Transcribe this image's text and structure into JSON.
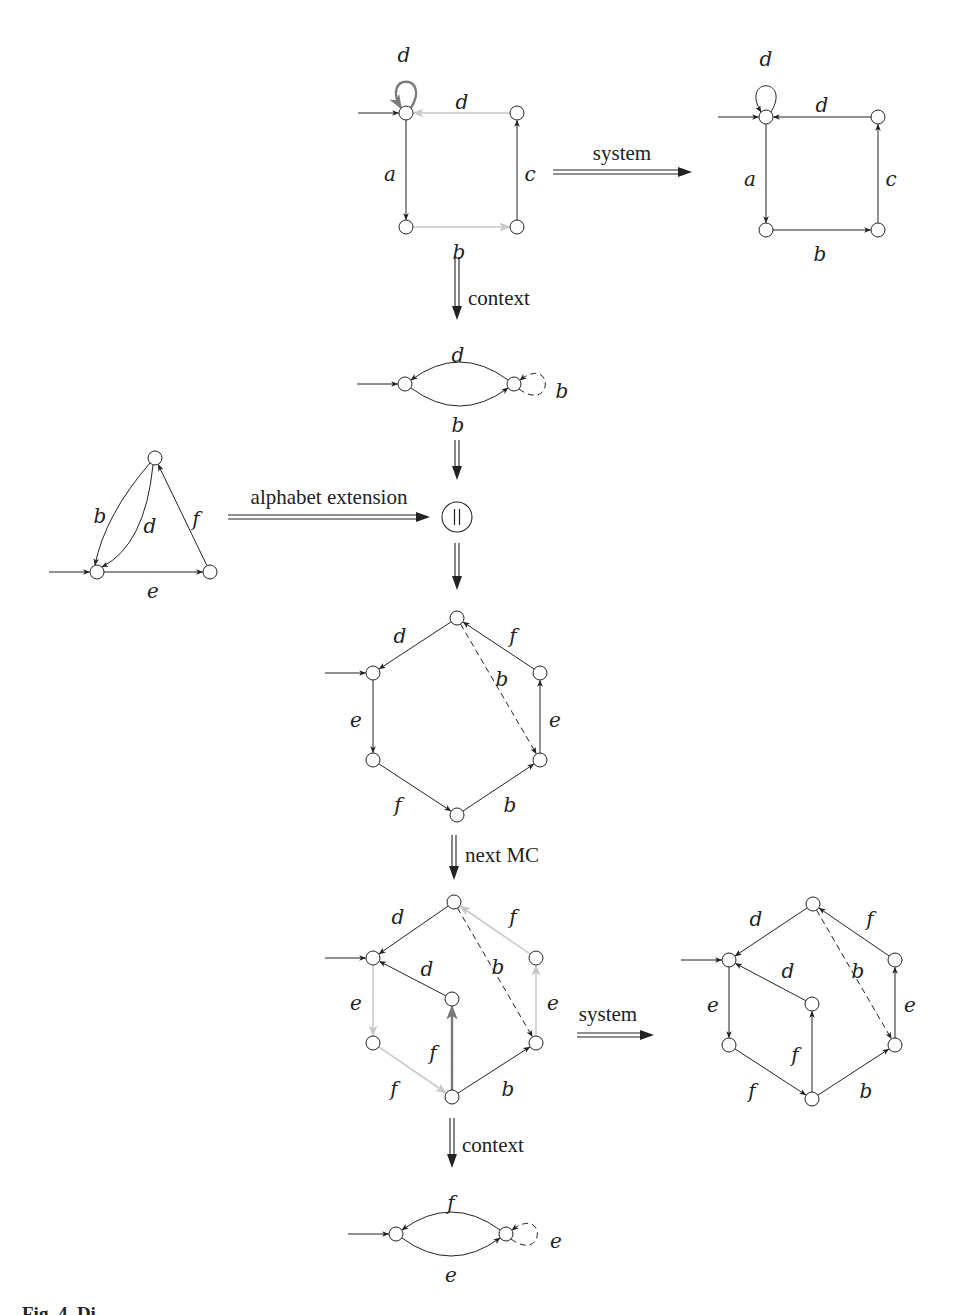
{
  "figure": {
    "caption_fragment": "Fig. 4. Di",
    "colors": {
      "ink": "#222222",
      "faded": "#c8c8c8",
      "highlight": "#7a7a7a",
      "node_fill": "#ffffff"
    },
    "node_radius": 7
  },
  "transitions": [
    {
      "id": "system-1",
      "label": "system",
      "orientation": "h",
      "x1": 553,
      "y1": 172,
      "x2": 692,
      "y2": 172,
      "label_x": 622,
      "label_y": 160
    },
    {
      "id": "context-1",
      "label": "context",
      "orientation": "v",
      "x1": 457,
      "y1": 257,
      "x2": 457,
      "y2": 320,
      "label_x": 468,
      "label_y": 305
    },
    {
      "id": "merge-in",
      "label": "",
      "orientation": "v",
      "x1": 457,
      "y1": 440,
      "x2": 457,
      "y2": 480
    },
    {
      "id": "alphabet-extension",
      "label": "alphabet extension",
      "orientation": "h",
      "x1": 228,
      "y1": 517,
      "x2": 430,
      "y2": 517,
      "label_x": 329,
      "label_y": 504
    },
    {
      "id": "merge-out",
      "label": "",
      "orientation": "v",
      "x1": 457,
      "y1": 543,
      "x2": 457,
      "y2": 590
    },
    {
      "id": "next-mc",
      "label": "next MC",
      "orientation": "v",
      "x1": 454,
      "y1": 835,
      "x2": 454,
      "y2": 880,
      "label_x": 465,
      "label_y": 862
    },
    {
      "id": "system-2",
      "label": "system",
      "orientation": "h",
      "x1": 577,
      "y1": 1035,
      "x2": 654,
      "y2": 1035,
      "label_x": 608,
      "label_y": 1021
    },
    {
      "id": "context-2",
      "label": "context",
      "orientation": "v",
      "x1": 452,
      "y1": 1118,
      "x2": 452,
      "y2": 1168,
      "label_x": 462,
      "label_y": 1152
    }
  ],
  "composition_node": {
    "label": "||",
    "x": 457,
    "y": 517,
    "r": 15
  },
  "automata": [
    {
      "id": "square-model-checked",
      "nodes": [
        {
          "id": "s0",
          "x": 406,
          "y": 113,
          "initial": true
        },
        {
          "id": "s1",
          "x": 406,
          "y": 227
        },
        {
          "id": "s2",
          "x": 517,
          "y": 227
        },
        {
          "id": "s3",
          "x": 517,
          "y": 113
        }
      ],
      "edges": [
        {
          "from": "s0",
          "to": "s0",
          "label": "d",
          "style": "loop-highlight",
          "lx": 404,
          "ly": 56
        },
        {
          "from": "s3",
          "to": "s0",
          "label": "d",
          "style": "faded",
          "lx": 462,
          "ly": 103
        },
        {
          "from": "s0",
          "to": "s1",
          "label": "a",
          "style": "solid",
          "lx": 390,
          "ly": 175
        },
        {
          "from": "s1",
          "to": "s2",
          "label": "b",
          "style": "faded",
          "lx": 459,
          "ly": 253
        },
        {
          "from": "s2",
          "to": "s3",
          "label": "c",
          "style": "solid",
          "lx": 530,
          "ly": 175
        }
      ]
    },
    {
      "id": "square-system",
      "nodes": [
        {
          "id": "t0",
          "x": 766,
          "y": 117,
          "initial": true
        },
        {
          "id": "t1",
          "x": 766,
          "y": 230
        },
        {
          "id": "t2",
          "x": 878,
          "y": 230
        },
        {
          "id": "t3",
          "x": 878,
          "y": 117
        }
      ],
      "edges": [
        {
          "from": "t0",
          "to": "t0",
          "label": "d",
          "style": "loop",
          "lx": 766,
          "ly": 60
        },
        {
          "from": "t3",
          "to": "t0",
          "label": "d",
          "style": "solid",
          "lx": 822,
          "ly": 106
        },
        {
          "from": "t0",
          "to": "t1",
          "label": "a",
          "style": "solid",
          "lx": 750,
          "ly": 180
        },
        {
          "from": "t1",
          "to": "t2",
          "label": "b",
          "style": "solid",
          "lx": 820,
          "ly": 255
        },
        {
          "from": "t2",
          "to": "t3",
          "label": "c",
          "style": "solid",
          "lx": 891,
          "ly": 180
        }
      ]
    },
    {
      "id": "context-1-automaton",
      "nodes": [
        {
          "id": "c0",
          "x": 405,
          "y": 384,
          "initial": true
        },
        {
          "id": "c1",
          "x": 514,
          "y": 384
        }
      ],
      "edges": [
        {
          "from": "c1",
          "to": "c0",
          "label": "d",
          "style": "arc-top",
          "lx": 458,
          "ly": 356
        },
        {
          "from": "c0",
          "to": "c1",
          "label": "b",
          "style": "arc-bottom",
          "lx": 458,
          "ly": 426
        },
        {
          "from": "c1",
          "to": "c1",
          "label": "b",
          "style": "loop-right-dashed",
          "lx": 562,
          "ly": 392
        }
      ]
    },
    {
      "id": "triangle-extension",
      "nodes": [
        {
          "id": "x0",
          "x": 97,
          "y": 572,
          "initial": true
        },
        {
          "id": "x1",
          "x": 155,
          "y": 458
        },
        {
          "id": "x2",
          "x": 210,
          "y": 572
        }
      ],
      "edges": [
        {
          "from": "x1",
          "to": "x0",
          "label": "b",
          "style": "curve-left",
          "lx": 100,
          "ly": 517
        },
        {
          "from": "x1",
          "to": "x0",
          "label": "d",
          "style": "curve-right",
          "lx": 150,
          "ly": 527
        },
        {
          "from": "x2",
          "to": "x1",
          "label": "f",
          "style": "solid",
          "lx": 196,
          "ly": 520
        },
        {
          "from": "x0",
          "to": "x2",
          "label": "e",
          "style": "solid",
          "lx": 153,
          "ly": 592
        }
      ]
    },
    {
      "id": "hexagon-composed",
      "nodes": [
        {
          "id": "h0",
          "x": 457,
          "y": 618
        },
        {
          "id": "h1",
          "x": 373,
          "y": 673,
          "initial": true
        },
        {
          "id": "h2",
          "x": 373,
          "y": 760
        },
        {
          "id": "h3",
          "x": 457,
          "y": 815
        },
        {
          "id": "h4",
          "x": 540,
          "y": 760
        },
        {
          "id": "h5",
          "x": 540,
          "y": 673
        }
      ],
      "edges": [
        {
          "from": "h0",
          "to": "h1",
          "label": "d",
          "style": "solid",
          "lx": 400,
          "ly": 637
        },
        {
          "from": "h1",
          "to": "h2",
          "label": "e",
          "style": "solid",
          "lx": 356,
          "ly": 721
        },
        {
          "from": "h2",
          "to": "h3",
          "label": "f",
          "style": "solid",
          "lx": 398,
          "ly": 806
        },
        {
          "from": "h3",
          "to": "h4",
          "label": "b",
          "style": "solid",
          "lx": 510,
          "ly": 806
        },
        {
          "from": "h4",
          "to": "h5",
          "label": "e",
          "style": "solid",
          "lx": 555,
          "ly": 721
        },
        {
          "from": "h5",
          "to": "h0",
          "label": "f",
          "style": "solid",
          "lx": 513,
          "ly": 637
        },
        {
          "from": "h0",
          "to": "h4",
          "label": "b",
          "style": "dashed",
          "lx": 502,
          "ly": 680
        }
      ]
    },
    {
      "id": "hexagon-model-checked",
      "nodes": [
        {
          "id": "m0",
          "x": 454,
          "y": 902
        },
        {
          "id": "m1",
          "x": 373,
          "y": 958,
          "initial": true
        },
        {
          "id": "m2",
          "x": 373,
          "y": 1043
        },
        {
          "id": "m3",
          "x": 452,
          "y": 1097
        },
        {
          "id": "m4",
          "x": 536,
          "y": 1043
        },
        {
          "id": "m5",
          "x": 536,
          "y": 958
        },
        {
          "id": "m6",
          "x": 452,
          "y": 999
        }
      ],
      "edges": [
        {
          "from": "m0",
          "to": "m1",
          "label": "d",
          "style": "solid",
          "lx": 398,
          "ly": 918
        },
        {
          "from": "m6",
          "to": "m1",
          "label": "d",
          "style": "solid",
          "lx": 427,
          "ly": 970
        },
        {
          "from": "m1",
          "to": "m2",
          "label": "e",
          "style": "faded",
          "lx": 356,
          "ly": 1004
        },
        {
          "from": "m2",
          "to": "m3",
          "label": "f",
          "style": "faded",
          "lx": 394,
          "ly": 1090
        },
        {
          "from": "m3",
          "to": "m6",
          "label": "f",
          "style": "highlight",
          "lx": 433,
          "ly": 1054
        },
        {
          "from": "m3",
          "to": "m4",
          "label": "b",
          "style": "solid",
          "lx": 508,
          "ly": 1090
        },
        {
          "from": "m4",
          "to": "m5",
          "label": "e",
          "style": "faded",
          "lx": 553,
          "ly": 1004
        },
        {
          "from": "m5",
          "to": "m0",
          "label": "f",
          "style": "faded",
          "lx": 513,
          "ly": 918
        },
        {
          "from": "m0",
          "to": "m4",
          "label": "b",
          "style": "dashed",
          "lx": 498,
          "ly": 968
        }
      ]
    },
    {
      "id": "hexagon-system",
      "nodes": [
        {
          "id": "n0",
          "x": 813,
          "y": 904
        },
        {
          "id": "n1",
          "x": 729,
          "y": 960,
          "initial": true
        },
        {
          "id": "n2",
          "x": 729,
          "y": 1045
        },
        {
          "id": "n3",
          "x": 812,
          "y": 1099
        },
        {
          "id": "n4",
          "x": 895,
          "y": 1045
        },
        {
          "id": "n5",
          "x": 895,
          "y": 960
        },
        {
          "id": "n6",
          "x": 812,
          "y": 1004
        }
      ],
      "edges": [
        {
          "from": "n0",
          "to": "n1",
          "label": "d",
          "style": "solid",
          "lx": 756,
          "ly": 920
        },
        {
          "from": "n6",
          "to": "n1",
          "label": "d",
          "style": "solid",
          "lx": 788,
          "ly": 972
        },
        {
          "from": "n1",
          "to": "n2",
          "label": "e",
          "style": "solid",
          "lx": 713,
          "ly": 1006
        },
        {
          "from": "n2",
          "to": "n3",
          "label": "f",
          "style": "solid",
          "lx": 752,
          "ly": 1092
        },
        {
          "from": "n3",
          "to": "n6",
          "label": "f",
          "style": "solid",
          "lx": 795,
          "ly": 1056
        },
        {
          "from": "n3",
          "to": "n4",
          "label": "b",
          "style": "solid",
          "lx": 866,
          "ly": 1092
        },
        {
          "from": "n4",
          "to": "n5",
          "label": "e",
          "style": "solid",
          "lx": 910,
          "ly": 1006
        },
        {
          "from": "n5",
          "to": "n0",
          "label": "f",
          "style": "solid",
          "lx": 870,
          "ly": 920
        },
        {
          "from": "n0",
          "to": "n4",
          "label": "b",
          "style": "dashed",
          "lx": 858,
          "ly": 972
        }
      ]
    },
    {
      "id": "context-2-automaton",
      "nodes": [
        {
          "id": "k0",
          "x": 396,
          "y": 1234,
          "initial": true
        },
        {
          "id": "k1",
          "x": 506,
          "y": 1234
        }
      ],
      "edges": [
        {
          "from": "k1",
          "to": "k0",
          "label": "f",
          "style": "arc-top",
          "lx": 451,
          "ly": 1204
        },
        {
          "from": "k0",
          "to": "k1",
          "label": "e",
          "style": "arc-bottom",
          "lx": 451,
          "ly": 1276
        },
        {
          "from": "k1",
          "to": "k1",
          "label": "e",
          "style": "loop-right-dashed",
          "lx": 556,
          "ly": 1242
        }
      ]
    }
  ]
}
